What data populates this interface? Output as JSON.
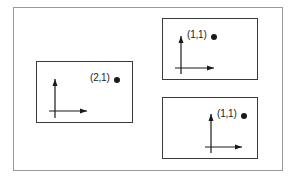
{
  "diagram": {
    "colors": {
      "outer_border": "#9a9a9a",
      "box_border": "#3a3a3a",
      "axis": "#1a1a1a",
      "dot": "#1a1a1a",
      "text": "#222222",
      "background": "#ffffff"
    },
    "frames": [
      {
        "id": "left-frame",
        "point_label": "(2,1)",
        "point_coords": [
          2,
          1
        ]
      },
      {
        "id": "top-right-frame",
        "point_label": "(1,1)",
        "point_coords": [
          1,
          1
        ]
      },
      {
        "id": "bottom-right-frame",
        "point_label": "(1,1)",
        "point_coords": [
          1,
          1
        ]
      }
    ]
  }
}
